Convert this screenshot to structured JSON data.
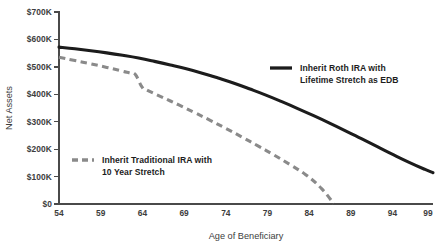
{
  "chart_data": {
    "type": "line",
    "title": "",
    "xlabel": "Age of Beneficiary",
    "ylabel": "Net Assets",
    "xlim": [
      54,
      101
    ],
    "ylim": [
      0,
      700000
    ],
    "grid": false,
    "legend_position": "inside",
    "x_ticks": [
      "54",
      "59",
      "64",
      "69",
      "74",
      "79",
      "84",
      "89",
      "94",
      "99"
    ],
    "x_tick_values": [
      54,
      59,
      64,
      69,
      74,
      79,
      84,
      89,
      94,
      99
    ],
    "y_ticks": [
      "$0",
      "$100K",
      "$200K",
      "$300K",
      "$400K",
      "$500K",
      "$600K",
      "$700K"
    ],
    "y_tick_values": [
      0,
      100000,
      200000,
      300000,
      400000,
      500000,
      600000,
      700000
    ],
    "series": [
      {
        "name": "Inherit Roth IRA with Lifetime Stretch as EDB",
        "style": "solid",
        "color": "#1c1c1c",
        "x": [
          54,
          56,
          58,
          60,
          62,
          64,
          66,
          68,
          70,
          72,
          74,
          76,
          78,
          80,
          82,
          84,
          86,
          88,
          90,
          92,
          94,
          96,
          98,
          100,
          101
        ],
        "values": [
          572000,
          566000,
          559000,
          551000,
          542000,
          532000,
          520000,
          507000,
          493000,
          477000,
          459000,
          440000,
          419000,
          397000,
          373000,
          348000,
          322000,
          295000,
          267000,
          238000,
          209000,
          180000,
          152000,
          126000,
          114000
        ]
      },
      {
        "name": "Inherit Traditional IRA with 10 Year Stretch",
        "style": "dashed",
        "color": "#8a8a8a",
        "x": [
          54,
          56,
          58,
          60,
          62,
          63,
          63.6,
          64.4,
          65,
          67,
          69,
          71,
          73,
          75,
          77,
          79,
          81,
          83,
          85,
          87,
          88.5
        ],
        "values": [
          535000,
          523000,
          511000,
          498000,
          484000,
          477000,
          472000,
          428000,
          416000,
          389000,
          362000,
          334000,
          305000,
          275000,
          244000,
          212000,
          179000,
          144000,
          107000,
          56000,
          2000
        ]
      }
    ],
    "legends": [
      {
        "label_line1": "Inherit Roth IRA with",
        "label_line2": "Lifetime Stretch as EDB",
        "style": "solid"
      },
      {
        "label_line1": "Inherit Traditional IRA with",
        "label_line2": "10 Year Stretch",
        "style": "dashed"
      }
    ]
  }
}
